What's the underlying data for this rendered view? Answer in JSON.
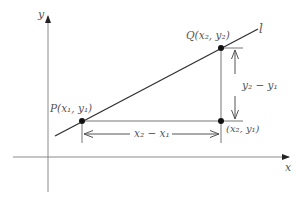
{
  "diagram": {
    "axes": {
      "x_label": "x",
      "y_label": "y"
    },
    "line_label": "l",
    "points": {
      "P": {
        "label": "P(x₁, y₁)"
      },
      "Q": {
        "label": "Q(x₂, y₂)"
      },
      "corner": {
        "label": "(x₂, y₁)"
      }
    },
    "measurements": {
      "run": "x₂ − x₁",
      "rise": "y₂ − y₁"
    },
    "colors": {
      "axis": "#8a8a8a",
      "line": "#333333",
      "point": "#111111",
      "text": "#555555"
    }
  }
}
